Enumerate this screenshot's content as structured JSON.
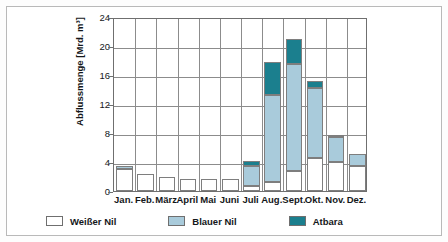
{
  "chart_data": {
    "type": "bar",
    "stacked": true,
    "title": "",
    "xlabel": "",
    "ylabel": "Abflussmenge [Mrd. m³]",
    "ylim": [
      0,
      24
    ],
    "ytick_labels": [
      "0",
      "4",
      "8",
      "12",
      "16",
      "20",
      "24"
    ],
    "yticks": [
      0,
      4,
      8,
      12,
      16,
      20,
      24
    ],
    "grid": "horizontal-and-vertical",
    "legend_position": "below-axes",
    "categories": [
      "Jan.",
      "Feb.",
      "März",
      "April",
      "Mai",
      "Juni",
      "Juli",
      "Aug.",
      "Sept.",
      "Okt.",
      "Nov.",
      "Dez."
    ],
    "series": [
      {
        "name": "Weißer Nil",
        "color": "#ffffff",
        "values": [
          3.0,
          2.3,
          2.0,
          1.65,
          1.6,
          1.7,
          0.7,
          1.2,
          2.7,
          4.5,
          4.0,
          3.4
        ]
      },
      {
        "name": "Blauer Nil",
        "color": "#a9cbdb",
        "values": [
          0.5,
          0.0,
          0.0,
          0.0,
          0.0,
          0.0,
          2.8,
          12.0,
          14.8,
          9.7,
          3.4,
          1.7
        ]
      },
      {
        "name": "Atbara",
        "color": "#1b7f8e",
        "values": [
          0.0,
          0.0,
          0.0,
          0.0,
          0.0,
          0.0,
          0.7,
          4.6,
          3.5,
          1.0,
          0.3,
          0.0
        ]
      }
    ],
    "totals": [
      3.5,
      2.3,
      2.0,
      1.65,
      1.6,
      1.7,
      4.2,
      17.8,
      21.0,
      15.2,
      7.7,
      5.1
    ]
  },
  "axis": {
    "y_title": "Abflussmenge [Mrd. m³]"
  },
  "legend": {
    "items": [
      {
        "label": "Weißer Nil",
        "color": "#ffffff"
      },
      {
        "label": "Blauer Nil",
        "color": "#a9cbdb"
      },
      {
        "label": "Atbara",
        "color": "#1b7f8e"
      }
    ]
  },
  "colors": {
    "white_nile": "#ffffff",
    "blue_nile": "#a9cbdb",
    "atbara": "#1b7f8e",
    "grid": "#8c8c8c",
    "axis": "#6f6f6f",
    "frame": "#b9b9b9",
    "text": "#14171a"
  }
}
